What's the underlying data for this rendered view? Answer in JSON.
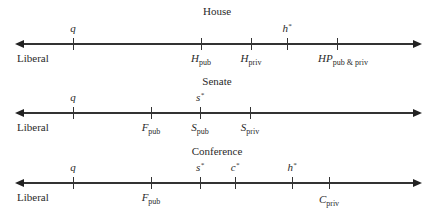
{
  "panels": [
    {
      "title": "House",
      "end_label": "Liberal",
      "ticks": [
        {
          "id": "q",
          "label_above": "q",
          "x": 73
        },
        {
          "id": "H_pub",
          "label_main": "H",
          "label_sub": "pub",
          "x": 201
        },
        {
          "id": "H_priv",
          "label_main": "H",
          "label_sub": "priv",
          "x": 251
        },
        {
          "id": "h_star",
          "label_above": "h",
          "label_sup": "*",
          "x": 287
        },
        {
          "id": "HP_pub_priv",
          "label_main": "HP",
          "label_sub": "pub & priv",
          "x": 337
        }
      ]
    },
    {
      "title": "Senate",
      "end_label": "Liberal",
      "ticks": [
        {
          "id": "q",
          "label_above": "q",
          "x": 73
        },
        {
          "id": "F_pub",
          "label_main": "F",
          "label_sub": "pub",
          "x": 151
        },
        {
          "id": "s_star",
          "label_above": "s",
          "label_sup": "*",
          "x": 200
        },
        {
          "id": "S_pub",
          "label_main": "S",
          "label_sub": "pub",
          "x": 200
        },
        {
          "id": "S_priv",
          "label_main": "S",
          "label_sub": "priv",
          "x": 250
        }
      ]
    },
    {
      "title": "Conference",
      "end_label": "Liberal",
      "ticks": [
        {
          "id": "q",
          "label_above": "q",
          "x": 73
        },
        {
          "id": "F_pub",
          "label_main": "F",
          "label_sub": "pub",
          "x": 151
        },
        {
          "id": "s_star",
          "label_above": "s",
          "label_sup": "*",
          "x": 200
        },
        {
          "id": "c_star",
          "label_above": "c",
          "label_sup": "*",
          "x": 235
        },
        {
          "id": "h_star",
          "label_above": "h",
          "label_sup": "*",
          "x": 292
        },
        {
          "id": "C_priv",
          "label_main": "C",
          "label_sub": "priv",
          "x": 329
        }
      ]
    }
  ]
}
